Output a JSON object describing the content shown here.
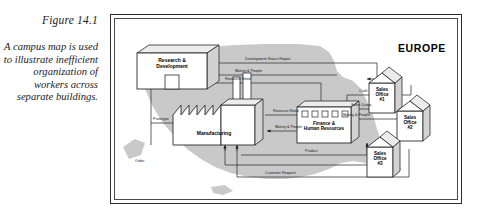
{
  "caption": {
    "figure_number": "Figure 14.1",
    "text": "A campus map is used to illustrate inefficient organization of workers across separate buildings."
  },
  "figure": {
    "region_label": "EUROPE",
    "buildings": [
      {
        "id": "rd",
        "label": "Research &\nDevelopment"
      },
      {
        "id": "manufacturing",
        "label": "Manufacturing"
      },
      {
        "id": "finance",
        "label": "Finance &\nHuman Resources"
      }
    ],
    "sales_offices": [
      {
        "id": "so1",
        "label": "Sales\nOffice\n#1"
      },
      {
        "id": "so2",
        "label": "Sales\nOffice\n#2"
      },
      {
        "id": "so3",
        "label": "Sales\nOffice\n#3"
      }
    ],
    "flow_labels": [
      {
        "id": "development-status-report",
        "text": "Development Status Report"
      },
      {
        "id": "money-people-top",
        "text": "Money & People"
      },
      {
        "id": "resource-need-top",
        "text": "Resource Need"
      },
      {
        "id": "prototype",
        "text": "Prototype"
      },
      {
        "id": "resource-need-mfg",
        "text": "Resource Need"
      },
      {
        "id": "money-people-mfg",
        "text": "Money & People"
      },
      {
        "id": "cash",
        "text": "Cash"
      },
      {
        "id": "sales-quota",
        "text": "Sales Quota"
      },
      {
        "id": "money-people-sales",
        "text": "Money & People"
      },
      {
        "id": "product",
        "text": "Product"
      },
      {
        "id": "order",
        "text": "Order"
      },
      {
        "id": "customer-request",
        "text": "Customer Request"
      }
    ],
    "colors": {
      "map_fill": "#c9c9c9",
      "frame_border": "#2c2c2c",
      "line": "#3a3a3a",
      "building_face": "#ffffff",
      "building_side": "#d9d9d9",
      "building_top": "#ececec"
    }
  }
}
